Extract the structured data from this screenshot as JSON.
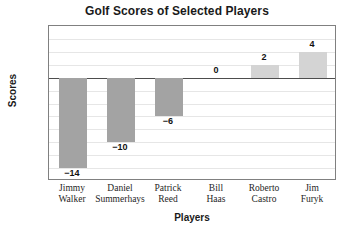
{
  "chart_data": {
    "type": "bar",
    "title": "Golf Scores of Selected Players",
    "xlabel": "Players",
    "ylabel": "Scores",
    "categories": [
      "Jimmy Walker",
      "Daniel Summerhays",
      "Patrick Reed",
      "Bill Haas",
      "Roberto Castro",
      "Jim Furyk"
    ],
    "category_lines": [
      [
        "Jimmy",
        "Walker"
      ],
      [
        "Daniel",
        "Summerhays"
      ],
      [
        "Patrick",
        "Reed"
      ],
      [
        "Bill",
        "Haas"
      ],
      [
        "Roberto",
        "Castro"
      ],
      [
        "Jim",
        "Furyk"
      ]
    ],
    "values": [
      -14,
      -10,
      -6,
      0,
      2,
      4
    ],
    "value_labels": [
      "−14",
      "−10",
      "−6",
      "0",
      "2",
      "4"
    ],
    "ylim": [
      -16,
      8
    ],
    "ytick_values": [
      8,
      6,
      4,
      2,
      0,
      -2,
      -4,
      -6,
      -8,
      -10,
      -12,
      -14,
      -16
    ],
    "ytick_labels": [
      "8",
      "6",
      "4",
      "2",
      "0 (par)",
      "−2",
      "−4",
      "−6",
      "−8",
      "−10",
      "−12",
      "−14",
      "−16"
    ],
    "grid": true,
    "legend": false,
    "colors": {
      "negative_bar": "#a3a3a3",
      "positive_bar": "#d4d4d4",
      "zero_line": "#4d4d4d",
      "gridline": "#e6e6e6",
      "frame": "#808080",
      "text": "#1a1a1a",
      "background": "#ffffff"
    }
  }
}
